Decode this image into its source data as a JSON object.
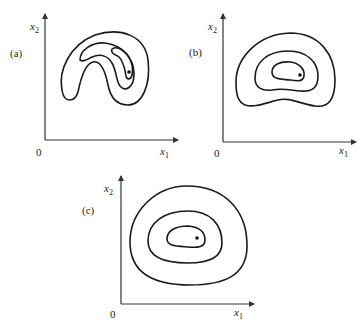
{
  "figure": {
    "panels": [
      {
        "id": "a",
        "label": "(a)",
        "origin_label": "0",
        "x_axis_label": "x",
        "x_axis_sub": "1",
        "y_axis_label": "x",
        "y_axis_sub": "2",
        "description": "Banana-shaped (curved) contours with minimum marked by a dot"
      },
      {
        "id": "b",
        "label": "(b)",
        "origin_label": "0",
        "x_axis_label": "x",
        "x_axis_sub": "1",
        "y_axis_label": "x",
        "y_axis_sub": "2",
        "description": "Mildly curved nested contours with minimum marked by a dot"
      },
      {
        "id": "c",
        "label": "(c)",
        "origin_label": "0",
        "x_axis_label": "x",
        "x_axis_sub": "1",
        "y_axis_label": "x",
        "y_axis_sub": "2",
        "description": "Nearly elliptical nested contours with minimum marked by a dot"
      }
    ],
    "colors": {
      "stroke": "#1a1a1a",
      "axis": "#333333",
      "background": "#ffffff"
    }
  }
}
